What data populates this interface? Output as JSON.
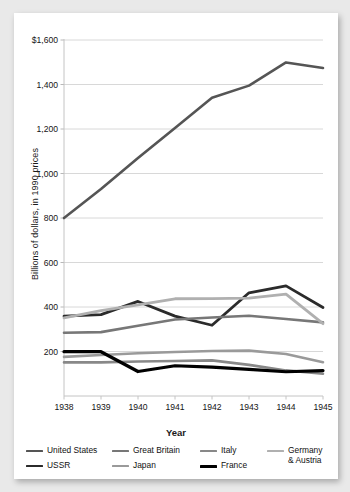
{
  "card": {
    "background": "#ffffff",
    "page_background": "#e9e9e9"
  },
  "axis": {
    "ylabel": "Billions of dollars, in 1990 prices",
    "xlabel": "Year"
  },
  "legend": {
    "items": [
      {
        "label": "United States",
        "color": "#555555",
        "width": 2.6
      },
      {
        "label": "USSR",
        "color": "#2b2b2b",
        "width": 2.8
      },
      {
        "label": "Great Britain",
        "color": "#777777",
        "width": 2.6
      },
      {
        "label": "Japan",
        "color": "#9a9a9a",
        "width": 2.6
      },
      {
        "label": "Italy",
        "color": "#888888",
        "width": 2.6
      },
      {
        "label": "France",
        "color": "#000000",
        "width": 3.2
      },
      {
        "label": "Germany & Austria",
        "color": "#b0b0b0",
        "width": 2.8
      }
    ]
  },
  "chart_data": {
    "type": "line",
    "title": "",
    "xlabel": "Year",
    "ylabel": "Billions of dollars, in 1990 prices",
    "categories": [
      "1938",
      "1939",
      "1940",
      "1941",
      "1942",
      "1943",
      "1944",
      "1945"
    ],
    "x": [
      1938,
      1939,
      1940,
      1941,
      1942,
      1943,
      1944,
      1945
    ],
    "ylim": [
      0,
      1600
    ],
    "yticks": [
      200,
      400,
      600,
      800,
      1000,
      1200,
      1400,
      1600
    ],
    "ytick_labels": [
      "200",
      "400",
      "600",
      "800",
      "1,000",
      "1,200",
      "1,400",
      "$1,600"
    ],
    "grid": true,
    "legend_position": "bottom",
    "series": [
      {
        "name": "United States",
        "color": "#555555",
        "width": 2.6,
        "values": [
          800,
          930,
          1070,
          1205,
          1340,
          1395,
          1499,
          1474
        ]
      },
      {
        "name": "USSR",
        "color": "#2b2b2b",
        "width": 2.8,
        "values": [
          359,
          366,
          425,
          359,
          318,
          464,
          495,
          398
        ]
      },
      {
        "name": "Great Britain",
        "color": "#777777",
        "width": 2.6,
        "values": [
          284,
          287,
          316,
          344,
          353,
          361,
          346,
          331
        ]
      },
      {
        "name": "Germany & Austria",
        "color": "#b0b0b0",
        "width": 2.8,
        "values": [
          351,
          384,
          410,
          437,
          438,
          440,
          458,
          325
        ]
      },
      {
        "name": "Japan",
        "color": "#9a9a9a",
        "width": 2.6,
        "values": [
          176,
          184,
          192,
          198,
          202,
          204,
          189,
          152
        ]
      },
      {
        "name": "Italy",
        "color": "#888888",
        "width": 2.6,
        "values": [
          151,
          151,
          155,
          157,
          160,
          140,
          115,
          100
        ]
      },
      {
        "name": "France",
        "color": "#000000",
        "width": 3.2,
        "values": [
          199,
          199,
          110,
          136,
          130,
          120,
          109,
          114
        ]
      }
    ]
  }
}
